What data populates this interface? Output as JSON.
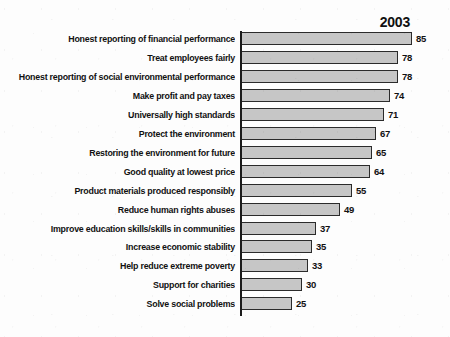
{
  "chart_data": {
    "type": "bar",
    "orientation": "horizontal",
    "title": "2003",
    "xlabel": "",
    "ylabel": "",
    "xlim": [
      0,
      85
    ],
    "grid": false,
    "legend": false,
    "value_labels": true,
    "categories": [
      "Honest reporting of financial performance",
      "Treat employees fairly",
      "Honest reporting of social environmental performance",
      "Make profit and pay taxes",
      "Universally high standards",
      "Protect the environment",
      "Restoring the environment for future",
      "Good quality at lowest price",
      "Product materials produced responsibly",
      "Reduce human rights abuses",
      "Improve education skills/skills in communities",
      "Increase economic stability",
      "Help reduce extreme poverty",
      "Support for charities",
      "Solve social problems"
    ],
    "values": [
      85,
      78,
      78,
      74,
      71,
      67,
      65,
      64,
      55,
      49,
      37,
      35,
      33,
      30,
      25
    ],
    "series": [
      {
        "name": "2003",
        "values": [
          85,
          78,
          78,
          74,
          71,
          67,
          65,
          64,
          55,
          49,
          37,
          35,
          33,
          30,
          25
        ]
      }
    ],
    "colors": {
      "bar_fill": "#c6c6c6",
      "bar_stroke": "#2b2b2b",
      "axis": "#1b1b1b",
      "text": "#111111",
      "background": "#fdfdfd"
    }
  },
  "rows": [
    {
      "label": "Honest reporting of financial performance",
      "value": "85"
    },
    {
      "label": "Treat employees fairly",
      "value": "78"
    },
    {
      "label": "Honest reporting of social environmental performance",
      "value": "78"
    },
    {
      "label": "Make profit and pay taxes",
      "value": "74"
    },
    {
      "label": "Universally high standards",
      "value": "71"
    },
    {
      "label": "Protect the environment",
      "value": "67"
    },
    {
      "label": "Restoring the environment for future",
      "value": "65"
    },
    {
      "label": "Good quality at lowest price",
      "value": "64"
    },
    {
      "label": "Product materials produced responsibly",
      "value": "55"
    },
    {
      "label": "Reduce human rights abuses",
      "value": "49"
    },
    {
      "label": "Improve education skills/skills in communities",
      "value": "37"
    },
    {
      "label": "Increase economic stability",
      "value": "35"
    },
    {
      "label": "Help reduce extreme poverty",
      "value": "33"
    },
    {
      "label": "Support for charities",
      "value": "30"
    },
    {
      "label": "Solve social problems",
      "value": "25"
    }
  ]
}
